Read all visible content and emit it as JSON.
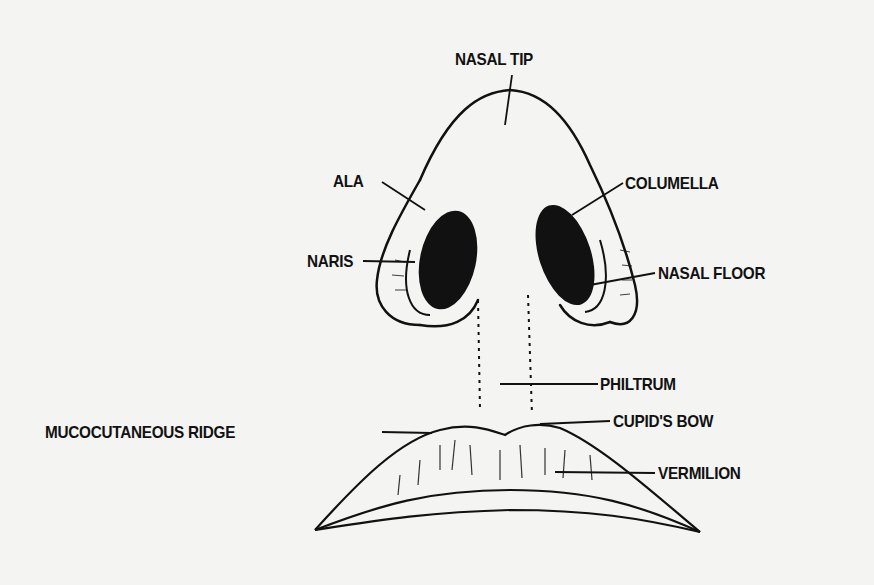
{
  "diagram": {
    "labels": {
      "nasal_tip": "NASAL TIP",
      "ala": "ALA",
      "columella": "COLUMELLA",
      "naris": "NARIS",
      "nasal_floor": "NASAL FLOOR",
      "philtrum": "PHILTRUM",
      "cupids_bow": "CUPID'S BOW",
      "mucocutaneous_ridge": "MUCOCUTANEOUS RIDGE",
      "vermilion": "VERMILION"
    },
    "colors": {
      "ink": "#111111",
      "paper": "#f4f4f2"
    }
  }
}
